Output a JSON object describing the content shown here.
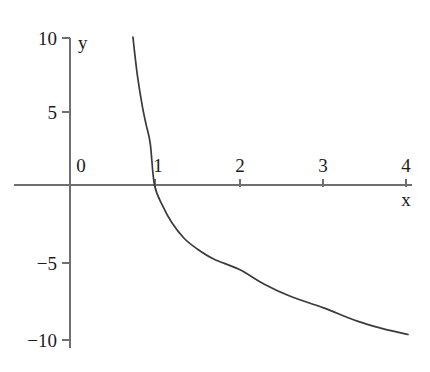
{
  "chart_data": {
    "type": "line",
    "title": "",
    "subtitle": "",
    "xlabel": "x",
    "ylabel": "y",
    "xlim": [
      0,
      4.05
    ],
    "ylim": [
      -10.6,
      10.6
    ],
    "grid": false,
    "legend": null,
    "x_ticks": [
      {
        "value": 0,
        "label": "0"
      },
      {
        "value": 1,
        "label": "1"
      },
      {
        "value": 2,
        "label": "2"
      },
      {
        "value": 3,
        "label": "3"
      },
      {
        "value": 4,
        "label": "4"
      }
    ],
    "y_ticks": [
      {
        "value": 10,
        "label": "10"
      },
      {
        "value": 5,
        "label": "5"
      },
      {
        "value": -5,
        "label": "−5"
      },
      {
        "value": -10,
        "label": "−10"
      }
    ],
    "series": [
      {
        "name": "curve",
        "color": "#3a3a3a",
        "x": [
          0.745,
          0.76,
          0.78,
          0.8,
          0.83,
          0.86,
          0.9,
          0.95,
          1.0,
          1.1,
          1.2,
          1.35,
          1.5,
          1.7,
          2.0,
          2.3,
          2.6,
          3.0,
          3.4,
          3.7,
          4.0
        ],
        "y": [
          10.0,
          9.2,
          8.2,
          7.3,
          6.2,
          5.2,
          4.1,
          2.8,
          0.0,
          -1.45,
          -2.5,
          -3.6,
          -4.3,
          -5.0,
          -5.7,
          -6.7,
          -7.5,
          -8.3,
          -9.2,
          -9.7,
          -10.1
        ]
      }
    ],
    "axis_color": "#6f6f6f",
    "curve_color": "#3a3a3a",
    "background": "#ffffff"
  },
  "geometry": {
    "origin_px": {
      "x": 70,
      "y": 185
    },
    "x_unit_px": 84.5,
    "y_unit_px": 14.8,
    "x_axis_end_px": 412,
    "y_axis_top_px": 38,
    "y_axis_bottom_px": 348
  },
  "labels": {
    "y_axis_name": "y",
    "x_axis_name": "x"
  }
}
